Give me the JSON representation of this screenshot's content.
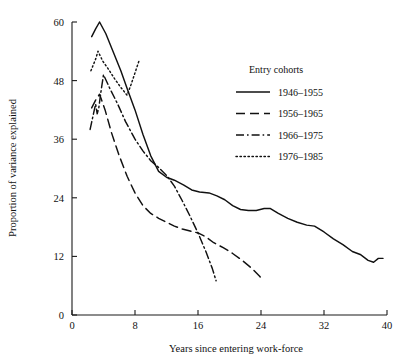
{
  "chart_data": {
    "type": "line",
    "title": "",
    "xlabel": "Years since entering work-force",
    "ylabel": "Proportion of variance explained",
    "xlim": [
      0,
      40
    ],
    "ylim": [
      0,
      60
    ],
    "xticks": [
      0,
      8,
      16,
      24,
      32,
      40
    ],
    "yticks": [
      0,
      12,
      24,
      36,
      48,
      60
    ],
    "xticklabels": [
      "0",
      "8",
      "16",
      "24",
      "32",
      "40"
    ],
    "yticklabels": [
      "0",
      "12",
      "24",
      "36",
      "48",
      "60"
    ],
    "grid": false,
    "legend_title": "Entry cohorts",
    "legend_position": "upper right inside",
    "series": [
      {
        "name": "1946–1955",
        "style": "solid",
        "points": [
          [
            2.5,
            57.0
          ],
          [
            3.0,
            58.6
          ],
          [
            3.5,
            60.0
          ],
          [
            4.3,
            57.6
          ],
          [
            5.2,
            54.0
          ],
          [
            6.2,
            50.0
          ],
          [
            7.0,
            46.4
          ],
          [
            8.0,
            42.0
          ],
          [
            9.0,
            37.0
          ],
          [
            10.0,
            32.6
          ],
          [
            11.0,
            29.4
          ],
          [
            12.0,
            28.2
          ],
          [
            13.0,
            27.6
          ],
          [
            14.2,
            26.6
          ],
          [
            15.2,
            25.6
          ],
          [
            16.2,
            25.2
          ],
          [
            17.4,
            25.0
          ],
          [
            18.4,
            24.4
          ],
          [
            19.4,
            23.6
          ],
          [
            20.4,
            22.4
          ],
          [
            21.4,
            21.6
          ],
          [
            22.4,
            21.4
          ],
          [
            23.4,
            21.4
          ],
          [
            24.4,
            21.8
          ],
          [
            25.2,
            21.8
          ],
          [
            26.2,
            20.8
          ],
          [
            27.4,
            19.8
          ],
          [
            28.6,
            19.0
          ],
          [
            29.8,
            18.4
          ],
          [
            30.8,
            18.2
          ],
          [
            32.0,
            17.0
          ],
          [
            33.2,
            15.6
          ],
          [
            34.4,
            14.4
          ],
          [
            35.6,
            13.0
          ],
          [
            36.6,
            12.4
          ],
          [
            37.6,
            11.2
          ],
          [
            38.3,
            10.8
          ],
          [
            38.9,
            11.6
          ],
          [
            39.5,
            11.6
          ]
        ]
      },
      {
        "name": "1956–1965",
        "style": "dashed",
        "points": [
          [
            2.5,
            42.4
          ],
          [
            3.0,
            44.0
          ],
          [
            3.5,
            45.2
          ],
          [
            4.2,
            42.0
          ],
          [
            5.0,
            37.4
          ],
          [
            6.0,
            32.6
          ],
          [
            7.0,
            28.4
          ],
          [
            8.0,
            25.0
          ],
          [
            9.0,
            22.4
          ],
          [
            10.0,
            20.8
          ],
          [
            11.0,
            19.8
          ],
          [
            12.0,
            19.0
          ],
          [
            13.0,
            18.2
          ],
          [
            14.0,
            17.6
          ],
          [
            15.0,
            17.2
          ],
          [
            16.0,
            16.8
          ],
          [
            17.0,
            16.0
          ],
          [
            18.0,
            14.8
          ],
          [
            19.2,
            13.8
          ],
          [
            20.4,
            12.6
          ],
          [
            21.6,
            11.2
          ],
          [
            22.8,
            9.6
          ],
          [
            23.8,
            8.0
          ],
          [
            24.3,
            7.0
          ]
        ]
      },
      {
        "name": "1966–1975",
        "style": "dashdot",
        "points": [
          [
            2.3,
            38.0
          ],
          [
            2.7,
            41.0
          ],
          [
            3.0,
            43.2
          ],
          [
            3.2,
            41.2
          ],
          [
            3.4,
            42.4
          ],
          [
            3.7,
            46.0
          ],
          [
            4.0,
            49.2
          ],
          [
            4.8,
            46.4
          ],
          [
            5.8,
            43.2
          ],
          [
            6.8,
            39.6
          ],
          [
            8.0,
            36.0
          ],
          [
            9.0,
            33.6
          ],
          [
            10.0,
            31.6
          ],
          [
            11.0,
            30.2
          ],
          [
            12.0,
            28.6
          ],
          [
            13.0,
            26.4
          ],
          [
            14.0,
            23.4
          ],
          [
            15.0,
            20.2
          ],
          [
            16.0,
            16.8
          ],
          [
            17.0,
            13.0
          ],
          [
            17.8,
            9.6
          ],
          [
            18.3,
            7.0
          ]
        ]
      },
      {
        "name": "1976–1985",
        "style": "dotted",
        "points": [
          [
            2.4,
            50.0
          ],
          [
            2.7,
            51.2
          ],
          [
            3.0,
            52.4
          ],
          [
            3.3,
            54.0
          ],
          [
            3.9,
            52.0
          ],
          [
            4.6,
            50.4
          ],
          [
            5.4,
            48.4
          ],
          [
            6.2,
            46.6
          ],
          [
            7.0,
            45.0
          ],
          [
            7.5,
            47.2
          ],
          [
            8.0,
            49.6
          ],
          [
            8.5,
            52.0
          ]
        ]
      }
    ]
  },
  "legend": {
    "title": "Entry cohorts",
    "items": [
      {
        "label": "1946–1955",
        "style": "solid"
      },
      {
        "label": "1956–1965",
        "style": "dashed"
      },
      {
        "label": "1966–1975",
        "style": "dashdot"
      },
      {
        "label": "1976–1985",
        "style": "dotted"
      }
    ]
  }
}
